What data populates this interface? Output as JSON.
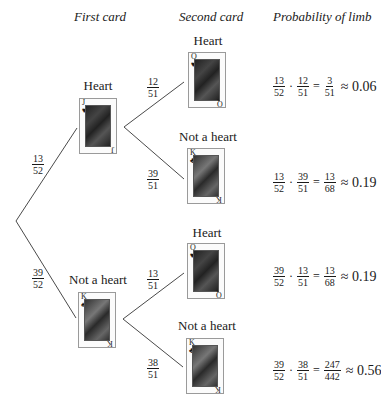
{
  "headers": {
    "first": "First card",
    "second": "Second card",
    "probability": "Probability of limb"
  },
  "first_level": [
    {
      "label": "Heart",
      "card": {
        "rank": "J",
        "suit": "♥",
        "suit_name": "hearts"
      },
      "branch_prob": {
        "num": "13",
        "den": "52"
      }
    },
    {
      "label": "Not a heart",
      "card": {
        "rank": "K",
        "suit": "♠",
        "suit_name": "spades"
      },
      "branch_prob": {
        "num": "39",
        "den": "52"
      }
    }
  ],
  "second_level": [
    {
      "label": "Heart",
      "card": {
        "rank": "Q",
        "suit": "♥",
        "suit_name": "hearts"
      },
      "branch_prob": {
        "num": "12",
        "den": "51"
      },
      "formula": {
        "a_num": "13",
        "a_den": "52",
        "b_num": "12",
        "b_den": "51",
        "eq": "=",
        "r_num": "3",
        "r_den": "51",
        "approx": "≈ 0.06"
      }
    },
    {
      "label": "Not a heart",
      "card": {
        "rank": "K",
        "suit": "♣",
        "suit_name": "clubs"
      },
      "branch_prob": {
        "num": "39",
        "den": "51"
      },
      "formula": {
        "a_num": "13",
        "a_den": "52",
        "b_num": "39",
        "b_den": "51",
        "eq": "=",
        "r_num": "13",
        "r_den": "68",
        "approx": "≈ 0.19"
      }
    },
    {
      "label": "Heart",
      "card": {
        "rank": "Q",
        "suit": "♥",
        "suit_name": "hearts"
      },
      "branch_prob": {
        "num": "13",
        "den": "51"
      },
      "formula": {
        "a_num": "39",
        "a_den": "52",
        "b_num": "13",
        "b_den": "51",
        "eq": "=",
        "r_num": "13",
        "r_den": "68",
        "approx": "≈ 0.19"
      }
    },
    {
      "label": "Not a heart",
      "card": {
        "rank": "K",
        "suit": "♣",
        "suit_name": "clubs"
      },
      "branch_prob": {
        "num": "38",
        "den": "51"
      },
      "formula": {
        "a_num": "39",
        "a_den": "52",
        "b_num": "38",
        "b_den": "51",
        "eq": "=",
        "r_num": "247",
        "r_den": "442",
        "approx": "≈ 0.56"
      }
    }
  ],
  "symbols": {
    "dot": "·"
  },
  "colors": {
    "ink": "#1a1a1a",
    "line": "#4a4a4a",
    "card_border": "#9a9a9a"
  }
}
